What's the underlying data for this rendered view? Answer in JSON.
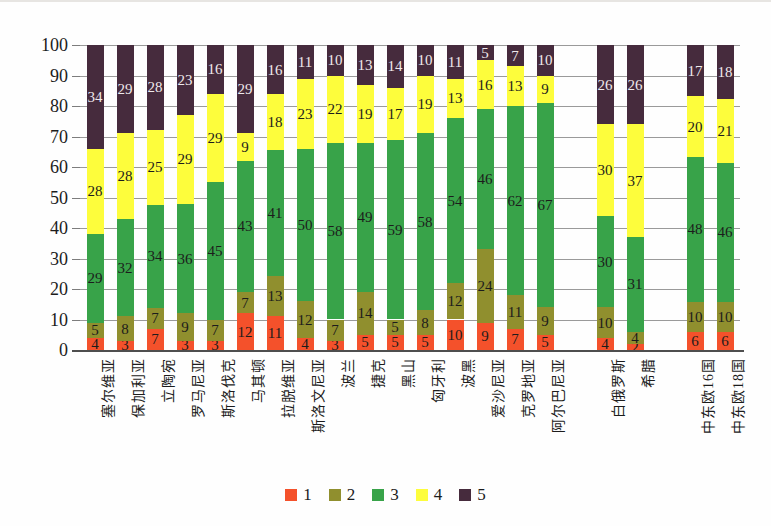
{
  "chart_data": {
    "type": "bar",
    "stacked": true,
    "orientation": "vertical",
    "title": "",
    "xlabel": "",
    "ylabel": "",
    "ylim": [
      0,
      100
    ],
    "ytick_interval": 10,
    "yticks": [
      "0",
      "10",
      "20",
      "30",
      "40",
      "50",
      "60",
      "70",
      "80",
      "90",
      "100"
    ],
    "grid": true,
    "legend_position": "bottom",
    "categories": [
      "塞尔维亚",
      "保加利亚",
      "立陶宛",
      "罗马尼亚",
      "斯洛伐克",
      "马其顿",
      "拉脱维亚",
      "斯洛文尼亚",
      "波兰",
      "捷克",
      "黑山",
      "匈牙利",
      "波黑",
      "爱沙尼亚",
      "克罗地亚",
      "阿尔巴尼亚",
      "白俄罗斯",
      "希腊",
      "中东欧16国",
      "中东欧18国"
    ],
    "category_slots": [
      0,
      1,
      2,
      3,
      4,
      5,
      6,
      7,
      8,
      9,
      10,
      11,
      12,
      13,
      14,
      15,
      17,
      18,
      20,
      21
    ],
    "total_slots": 22,
    "series": [
      {
        "name": "1",
        "color": "#f4512b",
        "values": [
          4,
          3,
          7,
          3,
          3,
          12,
          11,
          4,
          3,
          5,
          5,
          5,
          10,
          9,
          7,
          5,
          4,
          2,
          6,
          6
        ]
      },
      {
        "name": "2",
        "color": "#908f2e",
        "values": [
          5,
          8,
          7,
          9,
          7,
          7,
          13,
          12,
          7,
          14,
          5,
          8,
          12,
          24,
          11,
          9,
          10,
          4,
          10,
          10
        ]
      },
      {
        "name": "3",
        "color": "#38a349",
        "values": [
          29,
          32,
          34,
          36,
          45,
          43,
          41,
          50,
          58,
          49,
          59,
          58,
          54,
          46,
          62,
          67,
          30,
          31,
          48,
          46
        ]
      },
      {
        "name": "4",
        "color": "#fdfd3c",
        "values": [
          28,
          28,
          25,
          29,
          29,
          9,
          18,
          23,
          22,
          19,
          17,
          19,
          13,
          16,
          13,
          9,
          30,
          37,
          20,
          21
        ]
      },
      {
        "name": "5",
        "color": "#462b3d",
        "values": [
          34,
          29,
          28,
          23,
          16,
          29,
          16,
          11,
          10,
          13,
          14,
          10,
          11,
          5,
          7,
          10,
          26,
          26,
          17,
          18
        ]
      }
    ],
    "label_colors": {
      "default": "#1c1c1c",
      "on_dark_series": "#efe9ec",
      "dark_series_name": "5"
    },
    "axis_colors": {
      "gridline": "#9a9a9a",
      "axis_line": "#4e4e4e",
      "tick": "#7d7d7d"
    }
  }
}
